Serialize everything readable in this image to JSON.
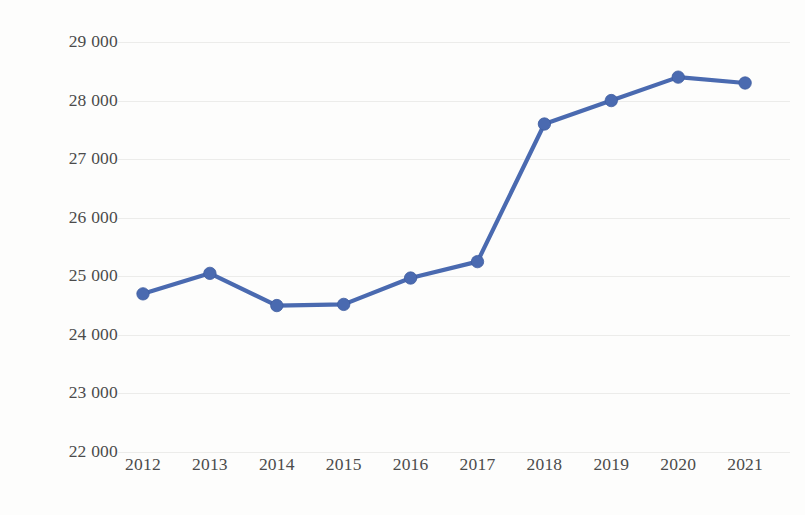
{
  "chart_data": {
    "type": "line",
    "title": "",
    "subtitle": "",
    "xlabel": "",
    "ylabel": "",
    "categories": [
      "2012",
      "2013",
      "2014",
      "2015",
      "2016",
      "2017",
      "2018",
      "2019",
      "2020",
      "2021"
    ],
    "x": [
      2012,
      2013,
      2014,
      2015,
      2016,
      2017,
      2018,
      2019,
      2020,
      2021
    ],
    "values": [
      24700,
      25050,
      24500,
      24520,
      24970,
      25250,
      27600,
      28000,
      28400,
      28300
    ],
    "series": [
      {
        "name": "",
        "values": [
          24700,
          25050,
          24500,
          24520,
          24970,
          25250,
          27600,
          28000,
          28400,
          28300
        ]
      }
    ],
    "ylim": [
      22000,
      29000
    ],
    "xlim": [
      2012,
      2021
    ],
    "ytick_values": [
      29000,
      28000,
      27000,
      26000,
      25000,
      24000,
      23000,
      22000
    ],
    "ytick_labels": [
      "29 000",
      "28 000",
      "27 000",
      "26 000",
      "25 000",
      "24 000",
      "23 000",
      "22 000"
    ],
    "xtick_labels": [
      "2012",
      "2013",
      "2014",
      "2015",
      "2016",
      "2017",
      "2018",
      "2019",
      "2020",
      "2021"
    ],
    "grid": true,
    "grid_axis": "y",
    "legend": false,
    "legend_position": "none",
    "markers": true,
    "annotations": [],
    "colors": {
      "series_line": "#4a6ab0",
      "marker": "#4a6ab0",
      "gridline": "#ececea",
      "tick_text": "#4b4b4b",
      "background": "#fdfdfc"
    }
  }
}
